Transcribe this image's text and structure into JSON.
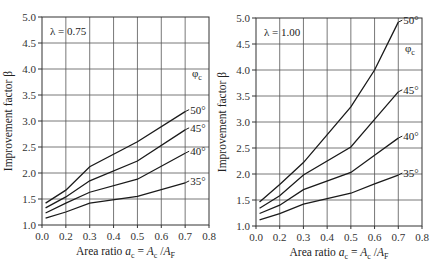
{
  "chart_data": [
    {
      "type": "line",
      "panel": "left",
      "annotation": "λ = 0.75",
      "legend_title": "φc",
      "xlabel": "Area ratio a_c = A_c / A_F",
      "ylabel": "Improvement factor β",
      "x_tick_labels": [
        "0.0",
        "0.2",
        "0.3",
        "0.4",
        "0.5",
        "0.6",
        "0.7",
        "0.8"
      ],
      "y_tick_labels": [
        "1.0",
        "1.5",
        "2.0",
        "2.5",
        "3.0",
        "3.5",
        "4.0",
        "4.5",
        "5.0"
      ],
      "ylim": [
        1.0,
        5.0
      ],
      "grid": true,
      "x": [
        0.03,
        0.2,
        0.3,
        0.5,
        0.7
      ],
      "series": [
        {
          "name": "50°",
          "values": [
            1.42,
            1.67,
            2.12,
            2.6,
            3.18
          ]
        },
        {
          "name": "45°",
          "values": [
            1.33,
            1.54,
            1.85,
            2.23,
            2.83
          ]
        },
        {
          "name": "40°",
          "values": [
            1.23,
            1.42,
            1.63,
            1.88,
            2.38
          ]
        },
        {
          "name": "35°",
          "values": [
            1.13,
            1.25,
            1.42,
            1.55,
            1.81
          ]
        }
      ]
    },
    {
      "type": "line",
      "panel": "right",
      "annotation": "λ = 1.00",
      "legend_title": "φc",
      "xlabel": "Area ratio a_c = A_c / A_F",
      "ylabel": "Improvement factor β",
      "x_tick_labels": [
        "0.0",
        "0.2",
        "0.3",
        "0.4",
        "0.5",
        "0.6",
        "0.7",
        "0.8"
      ],
      "y_tick_labels": [
        "1.0",
        "1.5",
        "2.0",
        "2.5",
        "3.0",
        "3.5",
        "4.0",
        "4.5",
        "5.0"
      ],
      "ylim": [
        1.0,
        5.0
      ],
      "grid": true,
      "x": [
        0.03,
        0.2,
        0.3,
        0.5,
        0.6,
        0.7
      ],
      "series": [
        {
          "name": "50°",
          "values": [
            1.46,
            1.8,
            2.22,
            3.29,
            4.0,
            4.92
          ]
        },
        {
          "name": "45°",
          "values": [
            1.34,
            1.58,
            1.98,
            2.52,
            3.05,
            3.58
          ]
        },
        {
          "name": "40°",
          "values": [
            1.24,
            1.4,
            1.7,
            2.03,
            2.36,
            2.69
          ]
        },
        {
          "name": "35°",
          "values": [
            1.12,
            1.24,
            1.42,
            1.63,
            1.81,
            1.98
          ]
        }
      ]
    }
  ],
  "labels": {
    "xlabel_prefix": "Area ratio ",
    "ylabel": "Improvement factor β",
    "phi": "φ",
    "phi_sub": "c"
  }
}
